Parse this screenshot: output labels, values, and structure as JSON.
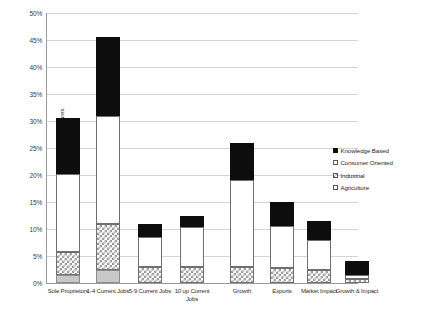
{
  "chart_data": {
    "type": "bar",
    "subtype": "stacked",
    "title": "",
    "xlabel": "",
    "ylabel": "Proportion of New Ventures",
    "ylim": [
      0,
      50
    ],
    "ytick_labels": [
      "0%",
      "5%",
      "10%",
      "15%",
      "20%",
      "25%",
      "30%",
      "35%",
      "40%",
      "45%",
      "50%"
    ],
    "ytick_values": [
      0,
      5,
      10,
      15,
      20,
      25,
      30,
      35,
      40,
      45,
      50
    ],
    "grid": true,
    "legend_position": "right",
    "categories": [
      "Sole Proprietors",
      "1-4 Current Jobs",
      "5-9 Current Jobs",
      "10 up Current Jobs",
      "Growth",
      "Exports",
      "Market Impact",
      "Growth & Impact"
    ],
    "series": [
      {
        "name": "Knowledge Based",
        "pattern": "solid-black",
        "color": "#0d0d0d",
        "values": [
          10.3,
          14.6,
          2.5,
          2.2,
          7.0,
          4.5,
          3.5,
          2.5
        ]
      },
      {
        "name": "Consumer Oriented",
        "pattern": "white",
        "color": "#ffffff",
        "values": [
          14.4,
          20.0,
          5.5,
          7.3,
          16.0,
          7.7,
          5.5,
          0.7
        ]
      },
      {
        "name": "Industrial",
        "pattern": "checkered",
        "color": "#9a9a9a",
        "values": [
          4.3,
          8.4,
          3.0,
          3.0,
          3.0,
          2.8,
          2.5,
          0.8
        ]
      },
      {
        "name": "Agriculture",
        "pattern": "solid-gray",
        "color": "#c8c8c8",
        "values": [
          1.5,
          2.5,
          0,
          0,
          0,
          0,
          0,
          0
        ]
      }
    ],
    "totals": [
      30.5,
      45.5,
      11.0,
      12.5,
      26.0,
      15.0,
      11.5,
      4.0
    ]
  },
  "legend": {
    "items": [
      {
        "label": "Knowledge Based"
      },
      {
        "label": "Consumer Oriented"
      },
      {
        "label": "Industrial"
      },
      {
        "label": "Agriculture"
      }
    ]
  }
}
